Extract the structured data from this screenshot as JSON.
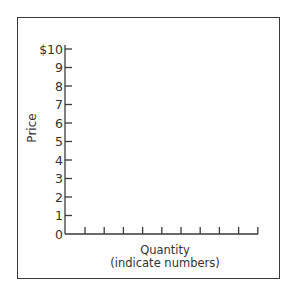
{
  "chart_data": {
    "type": "line",
    "title": "",
    "xlabel": "Quantity",
    "xlabel_note": "(indicate numbers)",
    "ylabel": "Price",
    "y_ticks": [
      "0",
      "1",
      "2",
      "3",
      "4",
      "5",
      "6",
      "7",
      "8",
      "9",
      "$10"
    ],
    "y_tick_values": [
      0,
      1,
      2,
      3,
      4,
      5,
      6,
      7,
      8,
      9,
      10
    ],
    "ylim": [
      0,
      10
    ],
    "x_tick_count": 10,
    "x_tick_labels": [],
    "series": [],
    "grid": false,
    "legend": null,
    "note": "Blank graph template with unlabeled quantity ticks"
  },
  "labels": {
    "ylabel": "Price",
    "xlabel": "Quantity",
    "xlabel_note": "(indicate numbers)"
  },
  "colors": {
    "axis": "#3a3a3a",
    "text": "#333333",
    "background": "#ffffff"
  }
}
